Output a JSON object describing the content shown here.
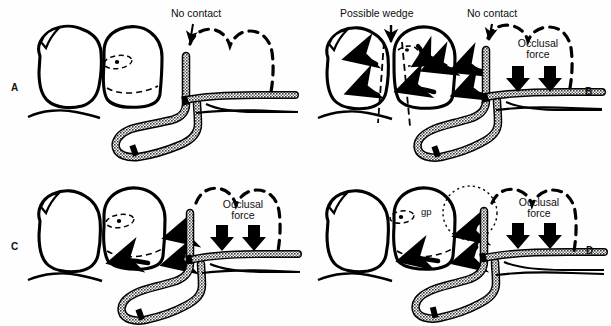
{
  "figure": {
    "width": 611,
    "height": 326,
    "background": "#ffffff",
    "ink": "#000000",
    "band_fill": "#8a8a8a"
  },
  "panels": [
    {
      "id": "A",
      "caption": "A",
      "labels": [
        {
          "name": "no-contact",
          "text": "No contact",
          "lines": [
            "No contact"
          ]
        }
      ],
      "arrows": {
        "straight_down": 0,
        "curved": 0,
        "pointer": 1
      },
      "features": [
        "proximal-box-outline",
        "dashed-adjacent-tooth",
        "matrix-band",
        "wedge-absent"
      ]
    },
    {
      "id": "B",
      "caption": "B",
      "labels": [
        {
          "name": "possible-wedge",
          "text": "Possible wedge",
          "lines": [
            "Possible wedge"
          ]
        },
        {
          "name": "no-contact",
          "text": "No contact",
          "lines": [
            "No contact"
          ]
        },
        {
          "name": "occlusal-force",
          "text": "Occlusal force",
          "lines": [
            "Occlusal",
            "force"
          ]
        }
      ],
      "arrows": {
        "straight_down": 2,
        "curved": 5,
        "pointer": 2
      },
      "features": [
        "wedge-dashed-lines",
        "dashed-adjacent-tooth",
        "matrix-band",
        "lateral-force-arrows"
      ]
    },
    {
      "id": "C",
      "caption": "C",
      "labels": [
        {
          "name": "occlusal-force",
          "text": "Occlusal force",
          "lines": [
            "Occlusal",
            "force"
          ]
        }
      ],
      "arrows": {
        "straight_down": 2,
        "curved": 3,
        "pointer": 0
      },
      "features": [
        "dashed-adjacent-tooth",
        "matrix-band",
        "condensation-arrows"
      ]
    },
    {
      "id": "D",
      "caption": "D",
      "labels": [
        {
          "name": "gp",
          "text": "gp",
          "lines": [
            "gp"
          ]
        },
        {
          "name": "occlusal-force",
          "text": "Occlusal force",
          "lines": [
            "Occlusal",
            "force"
          ]
        }
      ],
      "arrows": {
        "straight_down": 2,
        "curved": 3,
        "pointer": 0
      },
      "features": [
        "gp-dotted-circle",
        "dashed-adjacent-tooth",
        "matrix-band",
        "condensation-arrows"
      ]
    }
  ]
}
